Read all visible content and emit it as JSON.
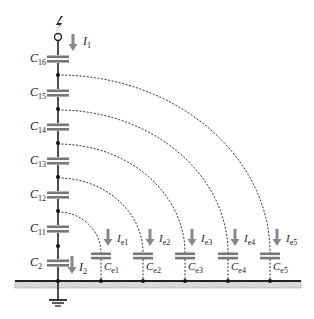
{
  "diagram": {
    "title": "",
    "source_symbol": "lightning-source",
    "colors": {
      "line": "#222222",
      "plate": "#777777",
      "arrow": "#888888",
      "bus_fill": "#dcdcdc",
      "dashed": "#333333"
    },
    "main_current": {
      "sym": "I",
      "sub": "1"
    },
    "bottom_current": {
      "sym": "I",
      "sub": "2"
    },
    "series_capacitors": [
      {
        "sym": "C",
        "sub": "16",
        "y": 59
      },
      {
        "sym": "C",
        "sub": "15",
        "y": 93
      },
      {
        "sym": "C",
        "sub": "14",
        "y": 127
      },
      {
        "sym": "C",
        "sub": "13",
        "y": 161
      },
      {
        "sym": "C",
        "sub": "12",
        "y": 195
      },
      {
        "sym": "C",
        "sub": "11",
        "y": 229
      },
      {
        "sym": "C",
        "sub": "2",
        "y": 263
      }
    ],
    "ground_capacitors": [
      {
        "sym": "C",
        "sub": "e1",
        "x": 101,
        "current_sym": "I",
        "current_sub": "e1",
        "from_y": 212
      },
      {
        "sym": "C",
        "sub": "e2",
        "x": 143,
        "current_sym": "I",
        "current_sub": "e2",
        "from_y": 178
      },
      {
        "sym": "C",
        "sub": "e3",
        "x": 185,
        "current_sym": "I",
        "current_sub": "e3",
        "from_y": 144
      },
      {
        "sym": "C",
        "sub": "e4",
        "x": 228,
        "current_sym": "I",
        "current_sub": "e4",
        "from_y": 110
      },
      {
        "sym": "C",
        "sub": "e5",
        "x": 270,
        "current_sym": "I",
        "current_sub": "e5",
        "from_y": 75
      }
    ],
    "ground_label": "ground"
  }
}
